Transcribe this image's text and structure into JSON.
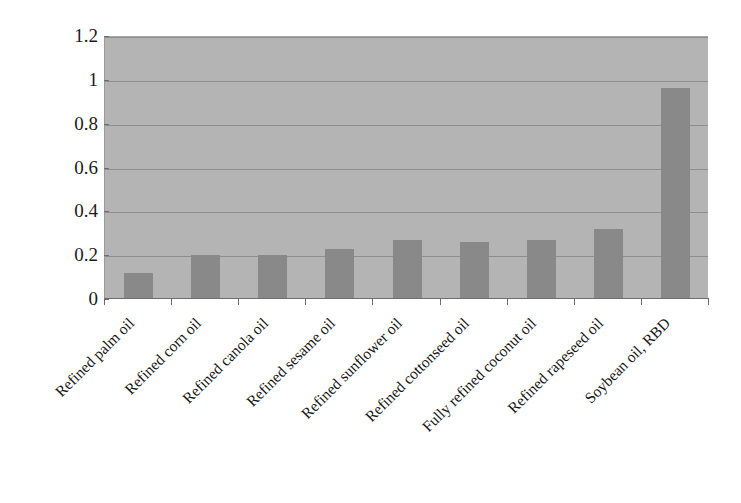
{
  "chart_data": {
    "type": "bar",
    "title": "",
    "xlabel": "",
    "ylabel": "",
    "categories": [
      "Refined palm oil",
      "Refined corn oil",
      "Refined canola oil",
      "Refined sesame oil",
      "Refined sunflower oil",
      "Refined cottonseed oil",
      "Fully refined coconut oil",
      "Refined rapeseed oil",
      "Soybean oil, RBD"
    ],
    "values": [
      0.12,
      0.2,
      0.2,
      0.23,
      0.27,
      0.26,
      0.27,
      0.32,
      0.965
    ],
    "ylim": [
      0,
      1.2
    ],
    "yticks": [
      "0",
      "0.2",
      "0.4",
      "0.6",
      "0.8",
      "1",
      "1.2"
    ],
    "ytick_values": [
      0,
      0.2,
      0.4,
      0.6,
      0.8,
      1,
      1.2
    ],
    "grid": true,
    "legend": false,
    "legend_position": "none",
    "bar_color": "#898989",
    "plot_background_color": "#b4b4b4",
    "gridline_color": "#8e8e8e",
    "axis_color": "#6e6e6e",
    "label_rotation_deg": -45
  }
}
